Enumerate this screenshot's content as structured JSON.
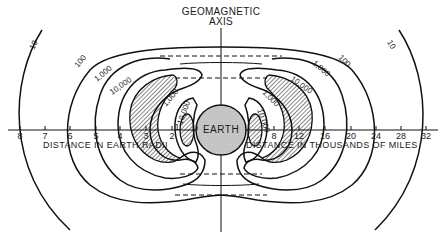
{
  "title": {
    "line1": "GEOMAGNETIC",
    "line2": "AXIS"
  },
  "center_label": "EARTH",
  "axis": {
    "left_label": "DISTANCE IN EARTH RADII",
    "right_label": "DISTANCE IN THOUSANDS OF MILES",
    "left_ticks": [
      "8",
      "7",
      "6",
      "5",
      "4",
      "3",
      "2",
      "1"
    ],
    "right_ticks": [
      "8",
      "12",
      "16",
      "20",
      "24",
      "28",
      "32"
    ]
  },
  "contours": {
    "left": [
      "10",
      "100",
      "1,000",
      "10,000",
      "1,000",
      "10,000"
    ],
    "right": [
      "10",
      "100",
      "1,000",
      "10,000",
      "1,000",
      "10,000"
    ]
  },
  "legend": {
    "hatched_region": "peak intensity zone"
  }
}
